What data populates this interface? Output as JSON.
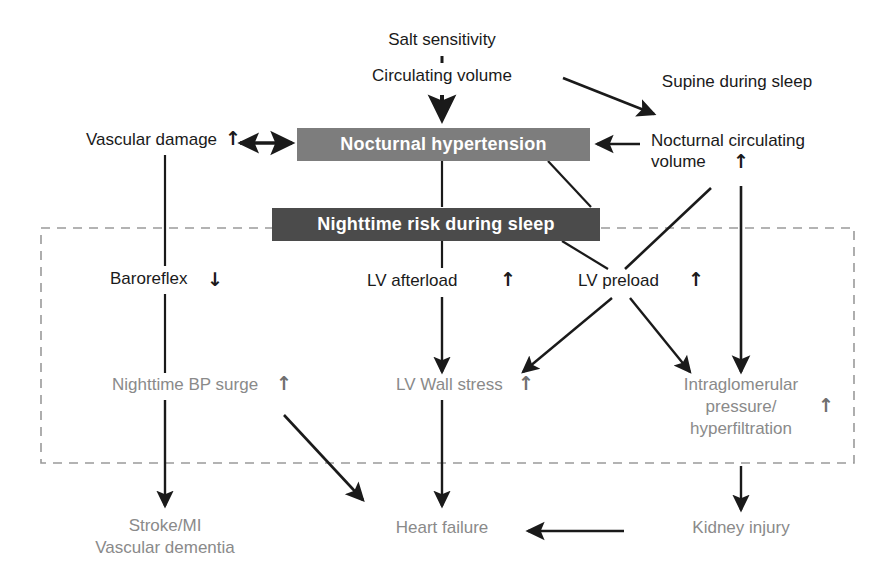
{
  "diagram": {
    "colors": {
      "bar_mid": "#7d7d7d",
      "bar_dark": "#4b4b4b",
      "text_black": "#1a1a1a",
      "text_gray": "#8a8a8a",
      "line": "#1a1a1a",
      "dashed_box": "#999999",
      "background": "#ffffff"
    },
    "bars": [
      {
        "id": "nocturnal-hypertension",
        "label": "Nocturnal hypertension",
        "style": "bar-mid"
      },
      {
        "id": "nighttime-risk",
        "label": "Nighttime risk during sleep",
        "style": "bar-dark"
      }
    ],
    "nodes": [
      {
        "id": "salt-sensitivity",
        "label": "Salt sensitivity",
        "color": "black"
      },
      {
        "id": "circulating-volume",
        "label": "Circulating volume",
        "color": "black"
      },
      {
        "id": "supine-during-sleep",
        "label": "Supine during sleep",
        "color": "black"
      },
      {
        "id": "vascular-damage",
        "label": "Vascular damage",
        "color": "black",
        "trend": "up"
      },
      {
        "id": "nocturnal-circulating-volume-line1",
        "label": "Nocturnal circulating",
        "color": "black"
      },
      {
        "id": "nocturnal-circulating-volume-line2",
        "label": "volume",
        "color": "black",
        "trend": "up"
      },
      {
        "id": "baroreflex",
        "label": "Baroreflex",
        "color": "black",
        "trend": "down"
      },
      {
        "id": "lv-afterload",
        "label": "LV afterload",
        "color": "black",
        "trend": "up"
      },
      {
        "id": "lv-preload",
        "label": "LV preload",
        "color": "black",
        "trend": "up"
      },
      {
        "id": "nighttime-bp-surge",
        "label": "Nighttime BP surge",
        "color": "gray",
        "trend": "up"
      },
      {
        "id": "lv-wall-stress",
        "label": "LV Wall stress",
        "color": "gray",
        "trend": "up"
      },
      {
        "id": "intraglomerular-line1",
        "label": "Intraglomerular",
        "color": "gray"
      },
      {
        "id": "intraglomerular-line2",
        "label": "pressure/",
        "color": "gray",
        "trend": "up"
      },
      {
        "id": "intraglomerular-line3",
        "label": "hyperfiltration",
        "color": "gray"
      },
      {
        "id": "stroke-mi",
        "label": "Stroke/MI",
        "color": "gray"
      },
      {
        "id": "vascular-dementia",
        "label": "Vascular dementia",
        "color": "gray"
      },
      {
        "id": "heart-failure",
        "label": "Heart failure",
        "color": "gray"
      },
      {
        "id": "kidney-injury",
        "label": "Kidney injury",
        "color": "gray"
      }
    ],
    "trend_glyphs": {
      "up": "↑",
      "down": "↓"
    },
    "text": {
      "salt_sensitivity": "Salt sensitivity",
      "circulating_volume": "Circulating volume",
      "supine_during_sleep": "Supine during sleep",
      "vascular_damage": "Vascular damage",
      "nocturnal_hypertension": "Nocturnal hypertension",
      "nighttime_risk_during_sleep": "Nighttime risk during sleep",
      "nocturnal_circulating_volume_l1": "Nocturnal circulating",
      "nocturnal_circulating_volume_l2": "volume",
      "baroreflex": "Baroreflex",
      "lv_afterload": "LV afterload",
      "lv_preload": "LV preload",
      "nighttime_bp_surge": "Nighttime BP surge",
      "lv_wall_stress": "LV Wall stress",
      "intraglomerular_l1": "Intraglomerular",
      "intraglomerular_l2": "pressure/",
      "intraglomerular_l3": "hyperfiltration",
      "stroke_mi": "Stroke/MI",
      "vascular_dementia": "Vascular dementia",
      "heart_failure": "Heart failure",
      "kidney_injury": "Kidney injury",
      "up_arrow": "↑",
      "down_arrow": "↓"
    },
    "edges": [
      {
        "from": "salt-sensitivity",
        "to": "circulating-volume",
        "style": "plain-short"
      },
      {
        "from": "circulating-volume",
        "to": "nocturnal-hypertension",
        "style": "arrow-down"
      },
      {
        "from": "circulating-volume",
        "to": "nocturnal-circulating-volume",
        "style": "arrow-diagonal"
      },
      {
        "from": "nocturnal-circulating-volume",
        "to": "nocturnal-hypertension",
        "style": "arrow-left"
      },
      {
        "from": "vascular-damage",
        "to": "nocturnal-hypertension",
        "style": "double-arrow"
      },
      {
        "from": "vascular-damage",
        "to": "baroreflex",
        "style": "plain-line"
      },
      {
        "from": "nocturnal-hypertension",
        "to": "nighttime-risk",
        "style": "plain-line"
      },
      {
        "from": "nocturnal-hypertension",
        "to": "nighttime-risk-right",
        "style": "plain-diagonal"
      },
      {
        "from": "nighttime-risk",
        "to": "lv-afterload",
        "style": "plain-line"
      },
      {
        "from": "nighttime-risk",
        "to": "lv-preload",
        "style": "plain-diagonal"
      },
      {
        "from": "nocturnal-circulating-volume",
        "to": "lv-preload",
        "style": "plain-diagonal"
      },
      {
        "from": "nocturnal-circulating-volume",
        "to": "intraglomerular",
        "style": "arrow-down-long"
      },
      {
        "from": "baroreflex",
        "to": "nighttime-bp-surge",
        "style": "plain-line"
      },
      {
        "from": "lv-afterload",
        "to": "lv-wall-stress",
        "style": "arrow-down"
      },
      {
        "from": "lv-preload",
        "to": "lv-wall-stress",
        "style": "arrow-diagonal-left"
      },
      {
        "from": "lv-preload",
        "to": "intraglomerular",
        "style": "arrow-diagonal-right"
      },
      {
        "from": "nighttime-bp-surge",
        "to": "stroke-mi",
        "style": "arrow-down"
      },
      {
        "from": "nighttime-bp-surge",
        "to": "heart-failure",
        "style": "arrow-diagonal-right"
      },
      {
        "from": "lv-wall-stress",
        "to": "heart-failure",
        "style": "arrow-down"
      },
      {
        "from": "intraglomerular",
        "to": "kidney-injury",
        "style": "arrow-down"
      },
      {
        "from": "kidney-injury",
        "to": "heart-failure",
        "style": "arrow-left"
      }
    ],
    "dashed_region": {
      "name": "nighttime-mechanisms-region",
      "x": 41,
      "y": 228,
      "width": 813,
      "height": 235
    }
  }
}
